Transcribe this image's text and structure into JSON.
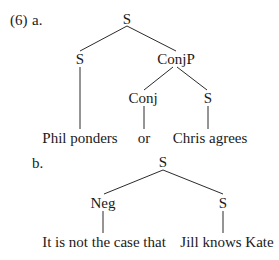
{
  "example": {
    "number": "(6)",
    "a": {
      "label": "a.",
      "nodes": {
        "root": "S",
        "left_s": "S",
        "conjp": "ConjP",
        "conj": "Conj",
        "right_s": "S"
      },
      "leaves": {
        "left": "Phil ponders",
        "conj": "or",
        "right": "Chris agrees"
      }
    },
    "b": {
      "label": "b.",
      "nodes": {
        "root": "S",
        "neg": "Neg",
        "s": "S"
      },
      "leaves": {
        "neg": "It is not the case that",
        "s": "Jill knows Kate"
      }
    }
  }
}
